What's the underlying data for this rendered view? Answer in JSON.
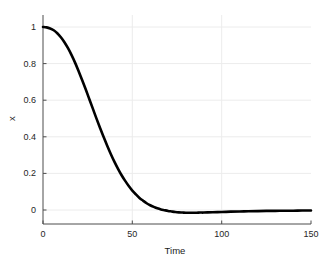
{
  "chart_data": {
    "type": "line",
    "title": "",
    "subtitle": "",
    "xlabel": "Time",
    "ylabel": "x",
    "xlim": [
      0,
      150
    ],
    "ylim": [
      -0.08,
      1.06
    ],
    "grid": true,
    "legend": null,
    "legend_position": "none",
    "xticks": [
      0,
      50,
      100,
      150
    ],
    "xticklabels": [
      "0",
      "50",
      "100",
      "150"
    ],
    "yticks": [
      0,
      0.2,
      0.4,
      0.6,
      0.8,
      1
    ],
    "yticklabels": [
      "0",
      "0.2",
      "0.4",
      "0.6",
      "0.8",
      "1"
    ],
    "series": [
      {
        "name": "x",
        "color": "#000000",
        "linewidth": 2.6,
        "x": [
          0,
          2,
          4,
          6,
          8,
          10,
          12,
          14,
          16,
          18,
          20,
          22,
          24,
          26,
          28,
          30,
          32,
          34,
          36,
          38,
          40,
          42,
          44,
          46,
          48,
          50,
          52,
          54,
          56,
          58,
          60,
          62,
          64,
          66,
          68,
          70,
          72,
          74,
          76,
          78,
          80,
          82,
          84,
          86,
          88,
          90,
          95,
          100,
          105,
          110,
          115,
          120,
          125,
          130,
          135,
          140,
          145,
          150
        ],
        "y": [
          1.0,
          0.998,
          0.992,
          0.982,
          0.966,
          0.944,
          0.917,
          0.884,
          0.846,
          0.804,
          0.757,
          0.708,
          0.657,
          0.604,
          0.551,
          0.498,
          0.447,
          0.397,
          0.35,
          0.305,
          0.263,
          0.225,
          0.19,
          0.159,
          0.131,
          0.106,
          0.085,
          0.066,
          0.051,
          0.037,
          0.026,
          0.017,
          0.009,
          0.003,
          -0.001,
          -0.005,
          -0.008,
          -0.011,
          -0.013,
          -0.014,
          -0.015,
          -0.015,
          -0.015,
          -0.015,
          -0.014,
          -0.014,
          -0.012,
          -0.011,
          -0.009,
          -0.008,
          -0.007,
          -0.006,
          -0.005,
          -0.005,
          -0.004,
          -0.004,
          -0.003,
          -0.003
        ]
      }
    ],
    "annotations": []
  },
  "axes": {
    "tick_label_color": "#262626",
    "axis_line_color": "#4d4d4d",
    "grid_color": "#ececec",
    "background": "#ffffff"
  }
}
